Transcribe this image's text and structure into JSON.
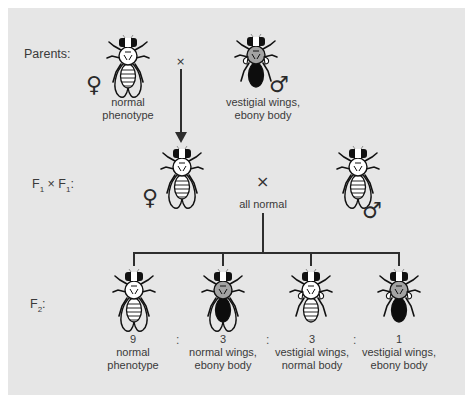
{
  "diagram": {
    "type": "genetic cross (dihybrid, Drosophila)",
    "colors": {
      "panel_bg": "#e6e6e6",
      "ink": "#1a1a1a",
      "thorax_ebony": "#9a9a9a",
      "text": "#3a3a3a"
    }
  },
  "rows": {
    "parents": {
      "label": "Parents:"
    },
    "f1": {
      "label_base": "F",
      "label_sub1": "1",
      "label_times": " × F",
      "label_sub2": "1",
      "label_colon": ":"
    },
    "f2": {
      "label_base": "F",
      "label_sub": "2",
      "label_colon": ":"
    }
  },
  "parents": {
    "female": {
      "symbol": "♀",
      "caption_line1": "normal",
      "caption_line2": "phenotype",
      "icon": "fly-normal-wings-normal-body"
    },
    "cross_symbol": "×",
    "male": {
      "symbol": "♂",
      "caption_line1": "vestigial wings,",
      "caption_line2": "ebony body",
      "icon": "fly-vestigial-wings-ebony-body"
    }
  },
  "f1": {
    "female": {
      "symbol": "♀",
      "icon": "fly-normal-wings-normal-body"
    },
    "cross_symbol": "×",
    "caption": "all normal",
    "male": {
      "symbol": "♂",
      "icon": "fly-normal-wings-normal-body"
    }
  },
  "f2": {
    "ratio_separator": ":",
    "offspring": [
      {
        "count": "9",
        "caption_line1": "normal",
        "caption_line2": "phenotype",
        "icon": "fly-normal-wings-normal-body"
      },
      {
        "count": "3",
        "caption_line1": "normal wings,",
        "caption_line2": "ebony body",
        "icon": "fly-normal-wings-ebony-body"
      },
      {
        "count": "3",
        "caption_line1": "vestigial wings,",
        "caption_line2": "normal body",
        "icon": "fly-vestigial-wings-normal-body"
      },
      {
        "count": "1",
        "caption_line1": "vestigial wings,",
        "caption_line2": "ebony body",
        "icon": "fly-vestigial-wings-ebony-body"
      }
    ]
  }
}
